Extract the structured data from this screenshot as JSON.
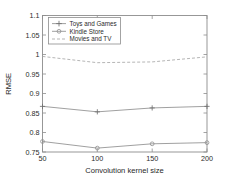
{
  "chart_data": {
    "type": "line",
    "title": "",
    "xlabel": "Convolution kernel size",
    "ylabel": "RMSE",
    "x": [
      50,
      100,
      150,
      200
    ],
    "xticklabels": [
      "50",
      "100",
      "150",
      "200"
    ],
    "yticklabels": [
      "0.75",
      "0.8",
      "0.85",
      "0.9",
      "0.95",
      "1",
      "1.05",
      "1.1"
    ],
    "ytickvalues": [
      0.75,
      0.8,
      0.85,
      0.9,
      0.95,
      1.0,
      1.05,
      1.1
    ],
    "xlim": [
      50,
      200
    ],
    "ylim": [
      0.75,
      1.1
    ],
    "grid": false,
    "legend_position": "upper left",
    "series": [
      {
        "name": "Toys and Games",
        "values": [
          0.867,
          0.853,
          0.863,
          0.867
        ],
        "marker": "plus",
        "linestyle": "solid",
        "color": "#8f8f8f"
      },
      {
        "name": "Kindle Store",
        "values": [
          0.777,
          0.76,
          0.771,
          0.774
        ],
        "marker": "circle",
        "linestyle": "solid",
        "color": "#8f8f8f"
      },
      {
        "name": "Movies and TV",
        "values": [
          0.995,
          0.979,
          0.981,
          0.994
        ],
        "marker": "none",
        "linestyle": "dashed",
        "color": "#a8a8a8"
      }
    ]
  },
  "legend": {
    "entries": [
      {
        "label": "Toys and Games"
      },
      {
        "label": "Kindle Store"
      },
      {
        "label": "Movies and TV"
      }
    ]
  },
  "colors": {
    "axis": "#8d8d8d",
    "text": "#2b2b2b",
    "background": "#ffffff"
  }
}
